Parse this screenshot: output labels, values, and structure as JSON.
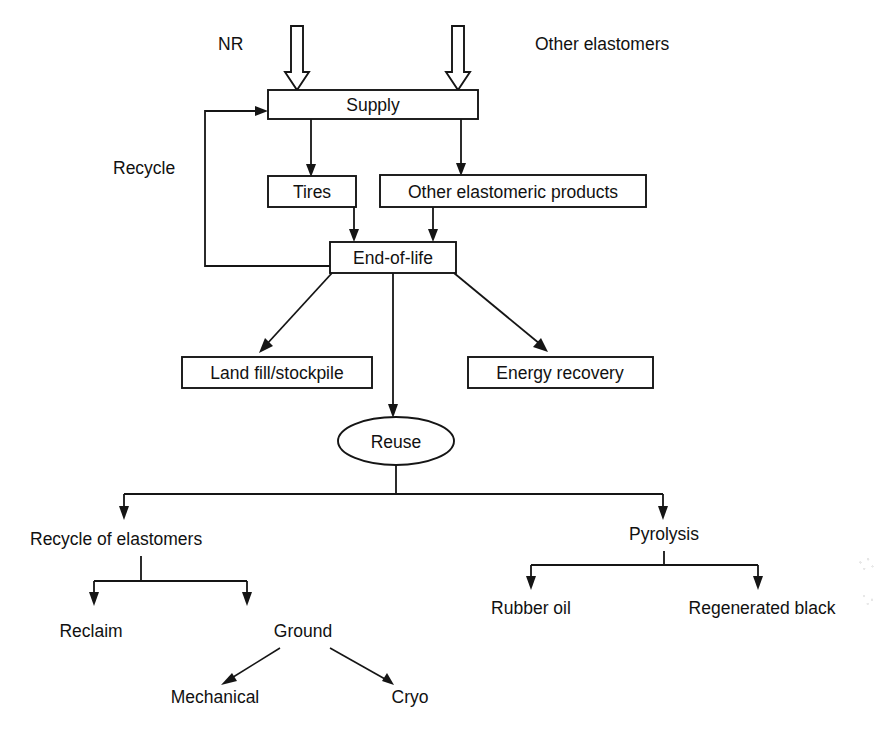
{
  "diagram": {
    "type": "flowchart",
    "orientation": "top-down",
    "colors": {
      "stroke": "#151515",
      "fill": "#ffffff",
      "text": "#111111",
      "background": "#ffffff"
    },
    "inputs": [
      {
        "id": "nr",
        "label": "NR",
        "shape": "text",
        "arrow": "hollow-down-arrow"
      },
      {
        "id": "other-elastomers",
        "label": "Other elastomers",
        "shape": "text",
        "arrow": "hollow-down-arrow"
      }
    ],
    "nodes": [
      {
        "id": "supply",
        "label": "Supply",
        "shape": "rectangle"
      },
      {
        "id": "tires",
        "label": "Tires",
        "shape": "rectangle"
      },
      {
        "id": "other-elastomeric-products",
        "label": "Other elastomeric products",
        "shape": "rectangle"
      },
      {
        "id": "end-of-life",
        "label": "End-of-life",
        "shape": "rectangle"
      },
      {
        "id": "land-fill-stockpile",
        "label": "Land fill/stockpile",
        "shape": "rectangle"
      },
      {
        "id": "energy-recovery",
        "label": "Energy recovery",
        "shape": "rectangle"
      },
      {
        "id": "reuse",
        "label": "Reuse",
        "shape": "ellipse"
      },
      {
        "id": "recycle-of-elastomers",
        "label": "Recycle of elastomers",
        "shape": "text"
      },
      {
        "id": "pyrolysis",
        "label": "Pyrolysis",
        "shape": "text"
      },
      {
        "id": "reclaim",
        "label": "Reclaim",
        "shape": "text"
      },
      {
        "id": "ground",
        "label": "Ground",
        "shape": "text"
      },
      {
        "id": "mechanical",
        "label": "Mechanical",
        "shape": "text"
      },
      {
        "id": "cryo",
        "label": "Cryo",
        "shape": "text"
      },
      {
        "id": "rubber-oil",
        "label": "Rubber oil",
        "shape": "text"
      },
      {
        "id": "regenerated-black",
        "label": "Regenerated black",
        "shape": "text"
      }
    ],
    "edge_labels": [
      {
        "id": "recycle",
        "label": "Recycle",
        "from": "end-of-life",
        "to": "supply"
      }
    ],
    "edges": [
      {
        "from": "nr",
        "to": "supply",
        "style": "hollow-arrow"
      },
      {
        "from": "other-elastomers",
        "to": "supply",
        "style": "hollow-arrow"
      },
      {
        "from": "supply",
        "to": "tires",
        "style": "arrow"
      },
      {
        "from": "supply",
        "to": "other-elastomeric-products",
        "style": "arrow"
      },
      {
        "from": "tires",
        "to": "end-of-life",
        "style": "arrow"
      },
      {
        "from": "other-elastomeric-products",
        "to": "end-of-life",
        "style": "arrow"
      },
      {
        "from": "end-of-life",
        "to": "supply",
        "style": "arrow",
        "label": "Recycle",
        "routing": "feedback-left"
      },
      {
        "from": "end-of-life",
        "to": "land-fill-stockpile",
        "style": "arrow"
      },
      {
        "from": "end-of-life",
        "to": "reuse",
        "style": "arrow"
      },
      {
        "from": "end-of-life",
        "to": "energy-recovery",
        "style": "arrow"
      },
      {
        "from": "reuse",
        "to": "recycle-of-elastomers",
        "style": "arrow",
        "routing": "split"
      },
      {
        "from": "reuse",
        "to": "pyrolysis",
        "style": "arrow",
        "routing": "split"
      },
      {
        "from": "recycle-of-elastomers",
        "to": "reclaim",
        "style": "arrow",
        "routing": "split"
      },
      {
        "from": "recycle-of-elastomers",
        "to": "ground",
        "style": "arrow",
        "routing": "split"
      },
      {
        "from": "ground",
        "to": "mechanical",
        "style": "arrow"
      },
      {
        "from": "ground",
        "to": "cryo",
        "style": "arrow"
      },
      {
        "from": "pyrolysis",
        "to": "rubber-oil",
        "style": "arrow",
        "routing": "split"
      },
      {
        "from": "pyrolysis",
        "to": "regenerated-black",
        "style": "arrow",
        "routing": "split"
      }
    ]
  }
}
